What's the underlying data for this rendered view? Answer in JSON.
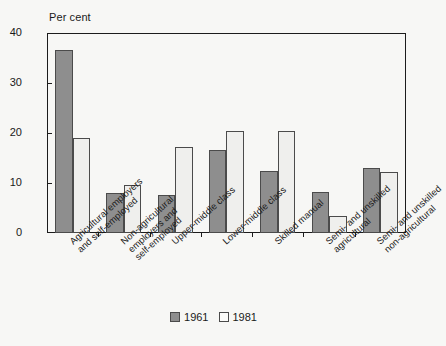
{
  "chart_data": {
    "type": "bar",
    "title": "",
    "subtitle": "",
    "xlabel": "",
    "ylabel": "Per cent",
    "ylim": [
      0,
      40
    ],
    "yticks": [
      0,
      10,
      20,
      30,
      40
    ],
    "grid": false,
    "legend_position": "bottom-center",
    "categories": [
      "Agricultural employers and self-employed",
      "Non-agricultural employers and self-employed",
      "Upper-middle class",
      "Lower-middle class",
      "Skilled manual",
      "Semi- and unskilled agricultural",
      "Semi- and unskilled non-agricultural"
    ],
    "category_lines": [
      [
        "Agricultural employers",
        "and self-employed"
      ],
      [
        "Non-agricultural",
        "employers and",
        "self-employed"
      ],
      [
        "Upper-middle class"
      ],
      [
        "Lower-middle class"
      ],
      [
        "Skilled manual"
      ],
      [
        "Semi- and unskilled",
        "agricultural"
      ],
      [
        "Semi- and unskilled",
        "non-agricultural"
      ]
    ],
    "series": [
      {
        "name": "1961",
        "color": "#8e8e8e",
        "values": [
          36.6,
          8.0,
          7.6,
          16.6,
          12.4,
          8.2,
          13.0
        ]
      },
      {
        "name": "1981",
        "color": "#efefed",
        "values": [
          19.1,
          9.7,
          17.2,
          20.4,
          20.4,
          3.4,
          12.2
        ]
      }
    ]
  },
  "axis": {
    "title": "Per cent",
    "ticks": [
      "40",
      "30",
      "20",
      "10",
      "0"
    ]
  },
  "legend": {
    "items": [
      {
        "label": "1961"
      },
      {
        "label": "1981"
      }
    ]
  },
  "colors": {
    "series_1961": "#8e8e8e",
    "series_1981": "#efefed",
    "axis": "#1c1c1c",
    "background": "#f7f7f5"
  }
}
